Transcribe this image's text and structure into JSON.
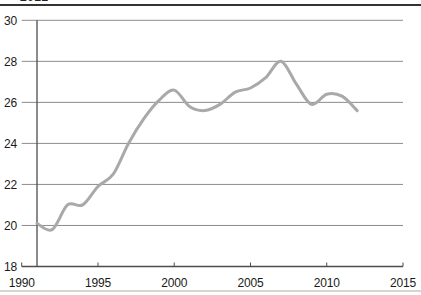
{
  "header": {
    "clipped_text": "2012"
  },
  "chart_data": {
    "type": "line",
    "title": "",
    "xlabel": "",
    "ylabel": "",
    "xlim": [
      1990,
      2015
    ],
    "ylim": [
      18,
      30
    ],
    "x_ticks": [
      1990,
      1995,
      2000,
      2005,
      2010,
      2015
    ],
    "y_ticks": [
      18,
      20,
      22,
      24,
      26,
      28,
      30
    ],
    "grid": "horizontal",
    "legend": "none",
    "x": [
      1991,
      1992,
      1993,
      1994,
      1995,
      1996,
      1997,
      1998,
      1999,
      2000,
      2001,
      2002,
      2003,
      2004,
      2005,
      2006,
      2007,
      2008,
      2009,
      2010,
      2011,
      2012
    ],
    "series": [
      {
        "name": "series-1",
        "values": [
          20.1,
          19.8,
          21.0,
          21.0,
          21.9,
          22.5,
          24.0,
          25.2,
          26.1,
          26.6,
          25.8,
          25.6,
          25.9,
          26.5,
          26.7,
          27.2,
          28.0,
          26.9,
          25.9,
          26.4,
          26.3,
          25.6
        ]
      }
    ],
    "colors": {
      "line": "#a9a9a9",
      "grid": "#8c8c8c",
      "axis": "#4d4d4d",
      "labels": "#1a1a1a",
      "top_rule": "#333333",
      "bottom_rule": "#d5d5d5",
      "background": "#ffffff"
    }
  }
}
